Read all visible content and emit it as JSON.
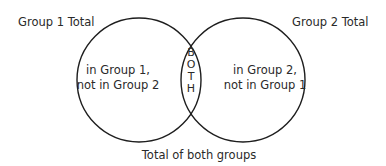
{
  "diagram": {
    "type": "venn",
    "sets": [
      {
        "id": "group1",
        "total_label": "Group 1 Total",
        "exclusive_label_lines": [
          "in Group 1,",
          "not in Group 2"
        ]
      },
      {
        "id": "group2",
        "total_label": "Group 2 Total",
        "exclusive_label_lines": [
          "in Group 2,",
          "not in Group 1"
        ]
      }
    ],
    "intersection": {
      "label": "BOTH",
      "letters": [
        "B",
        "O",
        "T",
        "H"
      ]
    },
    "union_label": "Total of both groups",
    "colors": {
      "stroke": "#1e1e1e",
      "text": "#2a2a2a",
      "background": "#ffffff"
    }
  }
}
